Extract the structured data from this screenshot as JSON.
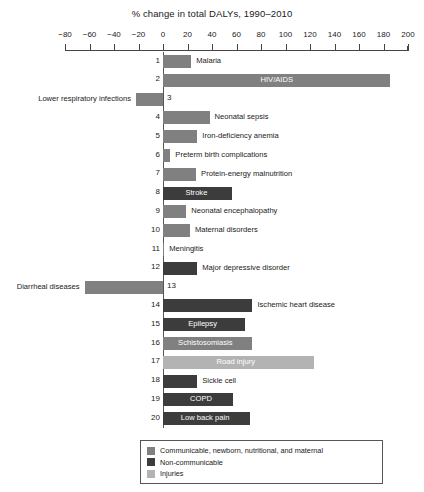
{
  "chart_data": {
    "type": "bar",
    "orientation": "horizontal",
    "title": "% change in total DALYs, 1990–2010",
    "xlabel": "",
    "ylabel": "",
    "xlim": [
      -80,
      200
    ],
    "xticks": [
      -80,
      -60,
      -40,
      -20,
      0,
      20,
      40,
      60,
      80,
      100,
      120,
      140,
      160,
      180,
      200
    ],
    "xtick_labels": [
      "−80",
      "−60",
      "−40",
      "−20",
      "0",
      "20",
      "40",
      "60",
      "80",
      "100",
      "120",
      "140",
      "160",
      "180",
      "200"
    ],
    "grid": false,
    "legend_position": "bottom",
    "categories": [
      "Malaria",
      "HIV/AIDS",
      "Lower respiratory infections",
      "Neonatal sepsis",
      "Iron-deficiency anemia",
      "Preterm birth complications",
      "Protein-energy malnutrition",
      "Stroke",
      "Neonatal encephalopathy",
      "Maternal disorders",
      "Meningitis",
      "Major depressive disorder",
      "Diarrheal diseases",
      "Ischemic heart disease",
      "Epilepsy",
      "Schistosomiasis",
      "Road injury",
      "Sickle cell",
      "COPD",
      "Low back pain"
    ],
    "values": [
      23,
      185,
      -22,
      38,
      28,
      6,
      27,
      56,
      19,
      22,
      1,
      28,
      -64,
      73,
      67,
      73,
      123,
      28,
      57,
      71
    ],
    "ranks": [
      "1",
      "2",
      "3",
      "4",
      "5",
      "6",
      "7",
      "8",
      "9",
      "10",
      "11",
      "12",
      "13",
      "14",
      "15",
      "16",
      "17",
      "18",
      "19",
      "20"
    ],
    "series_groups": [
      "communicable",
      "communicable",
      "communicable",
      "communicable",
      "communicable",
      "communicable",
      "communicable",
      "noncommunicable",
      "communicable",
      "communicable",
      "communicable",
      "noncommunicable",
      "communicable",
      "noncommunicable",
      "noncommunicable",
      "communicable",
      "injuries",
      "noncommunicable",
      "noncommunicable",
      "noncommunicable"
    ]
  },
  "colors": {
    "communicable": "#808080",
    "noncommunicable": "#3c3c3c",
    "injuries": "#b3b3b3",
    "axis": "#444444",
    "text": "#1a1a1a"
  },
  "legend": {
    "items": [
      {
        "label": "Communicable, newborn, nutritional, and maternal",
        "color_key": "communicable"
      },
      {
        "label": "Non-communicable",
        "color_key": "noncommunicable"
      },
      {
        "label": "Injuries",
        "color_key": "injuries"
      }
    ]
  }
}
